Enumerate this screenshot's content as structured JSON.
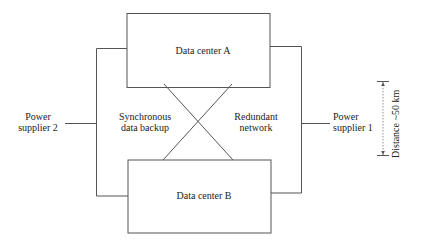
{
  "diagram": {
    "nodes": {
      "data_center_a": {
        "label": "Data center A"
      },
      "data_center_b": {
        "label": "Data center B"
      },
      "power_supplier_2": {
        "line1": "Power",
        "line2": "supplier 2"
      },
      "power_supplier_1": {
        "line1": "Power",
        "line2": "supplier 1"
      }
    },
    "annotations": {
      "sync_backup": {
        "line1": "Synchronous",
        "line2": "data backup"
      },
      "redundant_network": {
        "line1": "Redundant",
        "line2": "network"
      },
      "distance": "Distance ~50 km"
    },
    "colors": {
      "line": "#555555",
      "text": "#222222",
      "background": "#ffffff"
    }
  }
}
